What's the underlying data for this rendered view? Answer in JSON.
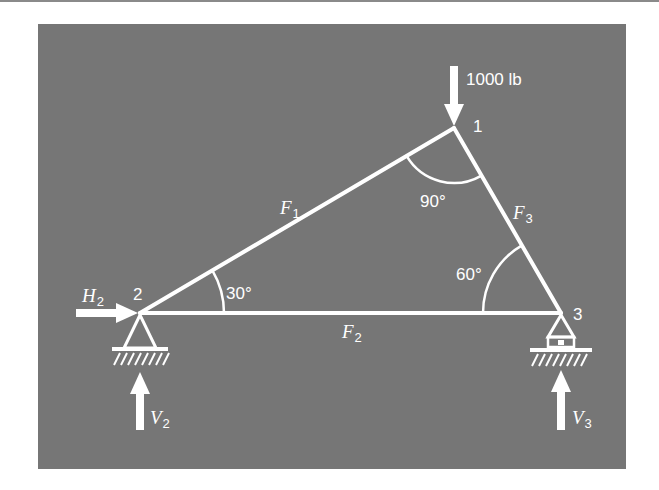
{
  "diagram": {
    "type": "truss",
    "background_color": "#767676",
    "line_color": "#ffffff",
    "nodes": [
      {
        "id": "1",
        "label": "1"
      },
      {
        "id": "2",
        "label": "2"
      },
      {
        "id": "3",
        "label": "3"
      }
    ],
    "members": [
      {
        "id": "F1",
        "symbol": "F",
        "sub": "1",
        "from": "2",
        "to": "1"
      },
      {
        "id": "F2",
        "symbol": "F",
        "sub": "2",
        "from": "2",
        "to": "3"
      },
      {
        "id": "F3",
        "symbol": "F",
        "sub": "3",
        "from": "1",
        "to": "3"
      }
    ],
    "angles": [
      {
        "node": "1",
        "label": "90°"
      },
      {
        "node": "2",
        "label": "30°"
      },
      {
        "node": "3",
        "label": "60°"
      }
    ],
    "loads": [
      {
        "node": "1",
        "label": "1000 lb",
        "direction": "down"
      }
    ],
    "reactions": [
      {
        "symbol": "H",
        "sub": "2",
        "node": "2",
        "direction": "right"
      },
      {
        "symbol": "V",
        "sub": "2",
        "node": "2",
        "direction": "up"
      },
      {
        "symbol": "V",
        "sub": "3",
        "node": "3",
        "direction": "up"
      }
    ],
    "supports": [
      {
        "node": "2",
        "type": "pin"
      },
      {
        "node": "3",
        "type": "roller"
      }
    ]
  }
}
